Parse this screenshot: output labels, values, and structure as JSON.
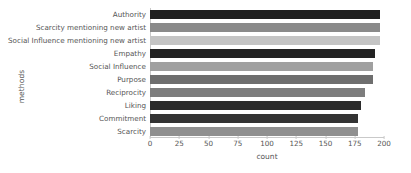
{
  "chart_data": {
    "type": "bar",
    "orientation": "horizontal",
    "title": "",
    "xlabel": "count",
    "ylabel": "methods",
    "xlim": [
      0,
      200
    ],
    "ylim": null,
    "grid": false,
    "legend": null,
    "xticks": [
      0,
      25,
      50,
      75,
      100,
      125,
      150,
      175,
      200
    ],
    "xtick_labels": [
      "0",
      "25",
      "50",
      "75",
      "100",
      "125",
      "150",
      "175",
      "200"
    ],
    "categories": [
      "Authority",
      "Scarcity mentioning new artist",
      "Social Influence mentioning new artist",
      "Empathy",
      "Social Influence",
      "Purpose",
      "Reciprocity",
      "Liking",
      "Commitment",
      "Scarcity"
    ],
    "values": [
      197,
      197,
      197,
      192,
      191,
      191,
      184,
      180,
      178,
      178
    ],
    "bar_colors": [
      "#1f1f1f",
      "#8a8a8a",
      "#c4c4c4",
      "#232323",
      "#a0a0a0",
      "#6e6e6e",
      "#7d7d7d",
      "#2b2b2b",
      "#333333",
      "#8f8f8f"
    ]
  },
  "axis": {
    "xlabel_text": "count",
    "ylabel_text": "methods"
  },
  "colors": {
    "background": "#ffffff",
    "text": "#555555",
    "spine": "#c9c9c9"
  }
}
